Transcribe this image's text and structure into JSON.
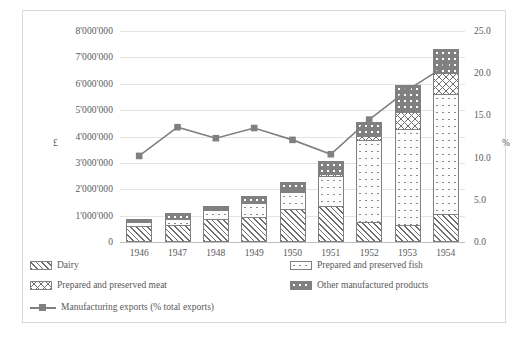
{
  "chart_data": {
    "type": "bar",
    "title": "",
    "subtitle": "",
    "categories": [
      "1946",
      "1947",
      "1948",
      "1949",
      "1950",
      "1951",
      "1952",
      "1953",
      "1954"
    ],
    "xlabel": "",
    "ylabel": "£",
    "ylabel_right": "%",
    "ylim": [
      0,
      8000000
    ],
    "ylim_right": [
      0,
      25.0
    ],
    "grid": true,
    "legend_position": "bottom",
    "y_ticks": [
      "0",
      "1'000'000",
      "2'000'000",
      "3'000'000",
      "4'000'000",
      "5'000'000",
      "6'000'000",
      "7'000'000",
      "8'000'000"
    ],
    "y_tick_values": [
      0,
      1000000,
      2000000,
      3000000,
      4000000,
      5000000,
      6000000,
      7000000,
      8000000
    ],
    "y_ticks_right": [
      "0.0",
      "5.0",
      "10.0",
      "15.0",
      "20.0",
      "25.0"
    ],
    "y_tick_values_right": [
      0,
      5,
      10,
      15,
      20,
      25
    ],
    "series": [
      {
        "name": "Dairy",
        "pattern": "diagonal-hatch",
        "axis": "left",
        "values": [
          600000,
          640000,
          880000,
          960000,
          1240000,
          1380000,
          740000,
          640000,
          1050000
        ]
      },
      {
        "name": "Prepared and preserved fish",
        "pattern": "light-dots",
        "axis": "left",
        "values": [
          200000,
          280000,
          360000,
          560000,
          700000,
          1160000,
          3180000,
          3680000,
          4600000
        ]
      },
      {
        "name": "Prepared and preserved meat",
        "pattern": "crosshatch",
        "axis": "left",
        "values": [
          40000,
          50000,
          60000,
          70000,
          80000,
          110000,
          180000,
          700000,
          850000
        ]
      },
      {
        "name": "Other manufactured products",
        "pattern": "dark-dots",
        "axis": "left",
        "values": [
          110000,
          200000,
          160000,
          260000,
          380000,
          550000,
          580000,
          1030000,
          950000
        ]
      },
      {
        "name": "Manufacturing exports (% total exports)",
        "pattern": "line-marker",
        "axis": "right",
        "values": [
          10.2,
          13.6,
          12.3,
          13.5,
          12.1,
          10.4,
          14.5,
          18.0,
          20.9
        ]
      }
    ]
  },
  "legend": {
    "items": [
      {
        "label": "Dairy"
      },
      {
        "label": "Prepared and preserved fish"
      },
      {
        "label": "Prepared and preserved meat"
      },
      {
        "label": "Other manufactured products"
      },
      {
        "label": "Manufacturing exports (% total exports)"
      }
    ]
  },
  "colors": {
    "series_line": "#808080",
    "grid": "#e4e4e4",
    "axis": "#bfbfbf",
    "text": "#595959",
    "frame": "#d9d9d9"
  },
  "caption": ""
}
